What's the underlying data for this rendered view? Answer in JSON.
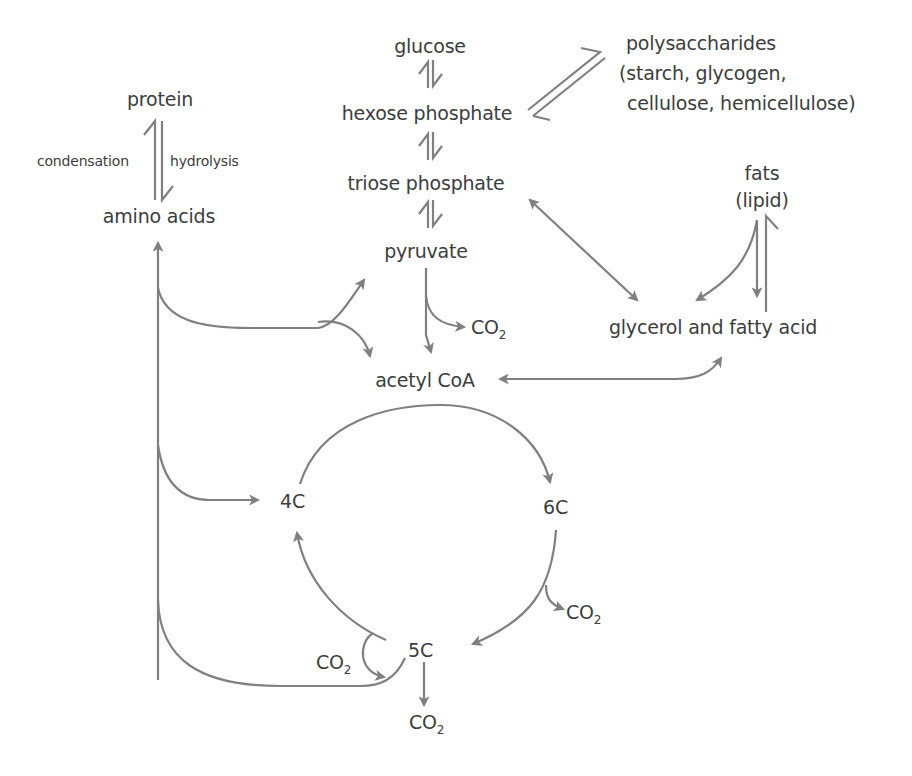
{
  "diagram": {
    "title_cutoff": "",
    "nodes": {
      "glucose": "glucose",
      "hexose_phosphate": "hexose phosphate",
      "triose_phosphate": "triose phosphate",
      "pyruvate": "pyruvate",
      "polysaccharides": "polysaccharides",
      "polysaccharides_detail_1": "(starch, glycogen,",
      "polysaccharides_detail_2": "cellulose, hemicellulose)",
      "protein": "protein",
      "amino_acids": "amino acids",
      "condensation": "condensation",
      "hydrolysis": "hydrolysis",
      "fats": "fats",
      "lipid": "(lipid)",
      "glycerol_fatty_acid": "glycerol and fatty acid",
      "acetyl_coa": "acetyl CoA",
      "c4": "4C",
      "c6": "6C",
      "c5": "5C",
      "co2_main": "CO",
      "co2_sub": "2"
    },
    "colors": {
      "arrow": "#808080",
      "text": "#3d3d3d",
      "background": "#ffffff"
    }
  }
}
